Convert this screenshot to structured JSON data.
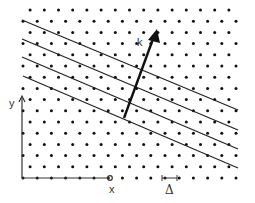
{
  "diagram": {
    "labels": {
      "k": "k",
      "x": "x",
      "y": "y",
      "delta": "Δ"
    },
    "colors": {
      "ink": "#222222",
      "background": "#ffffff"
    },
    "lattice": {
      "rows": 16,
      "row_spacing": 11.2,
      "col_spacing": 14.2,
      "origin": [
        23,
        10
      ]
    },
    "wavefront_lines": 4,
    "vector": {
      "from": [
        124,
        118
      ],
      "to": [
        157,
        30
      ]
    }
  }
}
